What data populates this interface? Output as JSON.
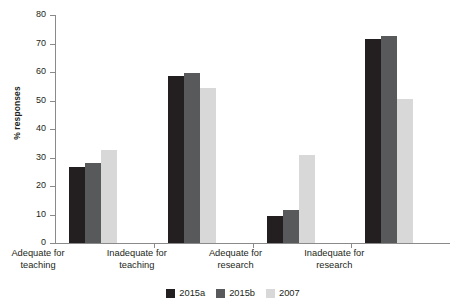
{
  "chart_data": {
    "type": "bar",
    "title": "",
    "xlabel": "",
    "ylabel": "% responses",
    "ylim": [
      0,
      80
    ],
    "yticks": [
      0,
      10,
      20,
      30,
      40,
      50,
      60,
      70,
      80
    ],
    "grid": false,
    "legend_position": "bottom",
    "categories": [
      "Adequate for teaching",
      "Inadequate for teaching",
      "Adequate for research",
      "Inadequate for research"
    ],
    "category_lines": [
      [
        "Adequate for",
        "teaching"
      ],
      [
        "Inadequate for",
        "teaching"
      ],
      [
        "Adequate for",
        "research"
      ],
      [
        "Inadequate for",
        "research"
      ]
    ],
    "series": [
      {
        "name": "2015a",
        "color": "#231f20",
        "values": [
          26.5,
          58.5,
          9.4,
          71.5
        ]
      },
      {
        "name": "2015b",
        "color": "#58595b",
        "values": [
          28.2,
          59.8,
          11.5,
          72.5
        ]
      },
      {
        "name": "2007",
        "color": "#d8d8d8",
        "values": [
          32.7,
          54.3,
          31.0,
          50.5
        ]
      }
    ]
  },
  "legend": {
    "items": [
      {
        "label": "2015a",
        "color": "#231f20"
      },
      {
        "label": "2015b",
        "color": "#58595b"
      },
      {
        "label": "2007",
        "color": "#d8d8d8"
      }
    ]
  },
  "axis": {
    "y_title": "% responses",
    "y_tick_labels": [
      "0",
      "10",
      "20",
      "30",
      "40",
      "50",
      "60",
      "70",
      "80"
    ]
  }
}
